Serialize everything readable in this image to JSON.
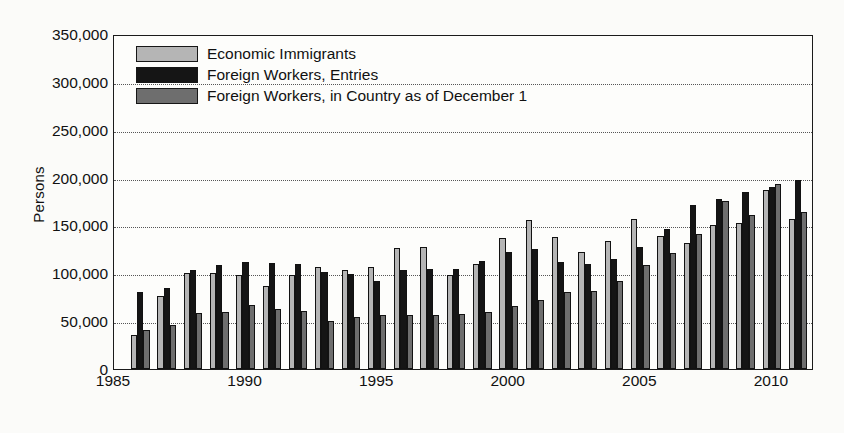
{
  "chart_data": {
    "type": "bar",
    "title": "",
    "subtitle": "",
    "xlabel": "",
    "ylabel": "Persons",
    "ylim": [
      0,
      350000
    ],
    "ytick_labels": [
      "0",
      "50,000",
      "100,000",
      "150,000",
      "200,000",
      "250,000",
      "300,000",
      "350,000"
    ],
    "ytick_values": [
      0,
      50000,
      100000,
      150000,
      200000,
      250000,
      300000,
      350000
    ],
    "xlim": [
      1985,
      2011.6
    ],
    "xtick_labels": [
      "1985",
      "1990",
      "1995",
      "2000",
      "2005",
      "2010"
    ],
    "xtick_values": [
      1985,
      1990,
      1995,
      2000,
      2005,
      2010
    ],
    "grid": "horizontal-dotted",
    "legend_position": "top-left-inside",
    "categories": [
      1986,
      1987,
      1988,
      1989,
      1990,
      1991,
      1992,
      1993,
      1994,
      1995,
      1996,
      1997,
      1998,
      1999,
      2000,
      2001,
      2002,
      2003,
      2004,
      2005,
      2006,
      2007,
      2008,
      2009,
      2010,
      2011
    ],
    "series": [
      {
        "name": "Economic Immigrants",
        "color": "#b5b5b5",
        "values": [
          36000,
          76000,
          100000,
          100000,
          98000,
          87000,
          98000,
          107000,
          103000,
          107000,
          126000,
          128000,
          98000,
          110000,
          137000,
          156000,
          138000,
          122000,
          134000,
          157000,
          139000,
          132000,
          150000,
          153000,
          187000,
          157000
        ]
      },
      {
        "name": "Foreign Workers, Entries",
        "color": "#151515",
        "values": [
          80000,
          85000,
          103000,
          109000,
          112000,
          111000,
          110000,
          101000,
          99000,
          92000,
          103000,
          104000,
          104000,
          113000,
          122000,
          125000,
          112000,
          110000,
          115000,
          128000,
          146000,
          171000,
          178000,
          185000,
          190000,
          197000
        ]
      },
      {
        "name": "Foreign Workers, in Country as of December 1",
        "color": "#6e6e6e",
        "values": [
          41000,
          46000,
          59000,
          60000,
          67000,
          63000,
          61000,
          50000,
          54000,
          56000,
          56000,
          56000,
          58000,
          60000,
          66000,
          72000,
          80000,
          82000,
          92000,
          109000,
          121000,
          141000,
          176000,
          161000,
          193000,
          164000
        ]
      }
    ],
    "bar_order_note": "Within each year group bars are drawn left-to-right: Economic Immigrants, Foreign Workers Entries, Foreign Workers in Country"
  },
  "legend": {
    "items": [
      {
        "label": "Economic Immigrants",
        "swatch": "s0"
      },
      {
        "label": "Foreign Workers, Entries",
        "swatch": "s1"
      },
      {
        "label": "Foreign Workers, in Country as of December 1",
        "swatch": "s2"
      }
    ]
  }
}
